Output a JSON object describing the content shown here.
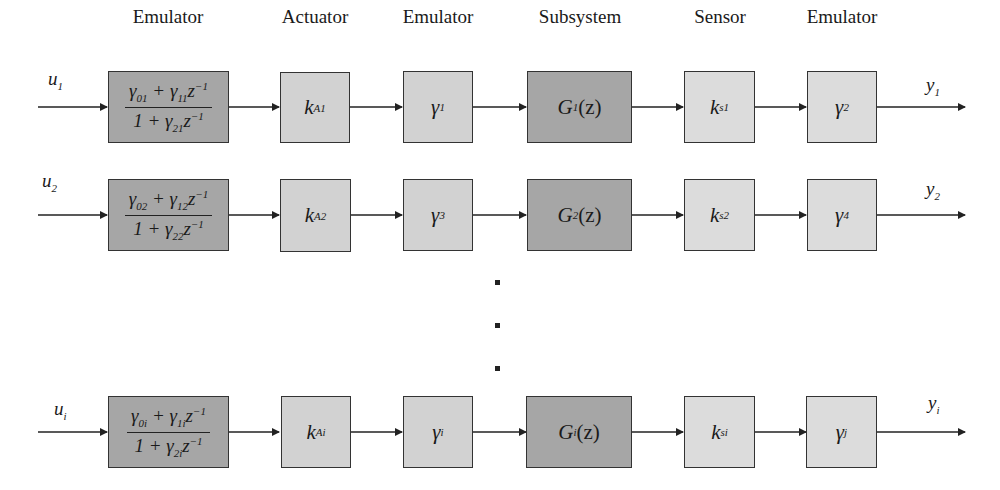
{
  "headers": [
    "Emulator",
    "Actuator",
    "Emulator",
    "Subsystem",
    "Sensor",
    "Emulator"
  ],
  "rows": [
    {
      "input": "u",
      "input_sub": "1",
      "output": "y",
      "output_sub": "1",
      "emulator_num": [
        "γ",
        "01",
        " + γ",
        "11",
        "z",
        "−1"
      ],
      "emulator_den": [
        "1 + γ",
        "21",
        "z",
        "−1"
      ],
      "actuator": [
        "k",
        "A1"
      ],
      "gamma_a": [
        "γ",
        "1"
      ],
      "subsystem": [
        "G",
        "1",
        "(z)"
      ],
      "sensor": [
        "k",
        "s1"
      ],
      "gamma_b": [
        "γ",
        "2"
      ]
    },
    {
      "input": "u",
      "input_sub": "2",
      "output": "y",
      "output_sub": "2",
      "emulator_num": [
        "γ",
        "02",
        " + γ",
        "12",
        "z",
        "−1"
      ],
      "emulator_den": [
        "1 + γ",
        "22",
        "z",
        "−1"
      ],
      "actuator": [
        "k",
        "A2"
      ],
      "gamma_a": [
        "γ",
        "3"
      ],
      "subsystem": [
        "G",
        "2",
        "(z)"
      ],
      "sensor": [
        "k",
        "s2"
      ],
      "gamma_b": [
        "γ",
        "4"
      ]
    },
    {
      "input": "u",
      "input_sub": "i",
      "output": "y",
      "output_sub": "i",
      "emulator_num": [
        "γ",
        "0i",
        " + γ",
        "1i",
        "z",
        "−1"
      ],
      "emulator_den": [
        "1 + γ",
        "2i",
        "z",
        "−1"
      ],
      "actuator": [
        "k",
        "Ai"
      ],
      "gamma_a": [
        "γ",
        "i"
      ],
      "subsystem": [
        "G",
        "i",
        "(z)"
      ],
      "sensor": [
        "k",
        "si"
      ],
      "gamma_b": [
        "γ",
        "j"
      ]
    }
  ],
  "ellipsis": "vertical dots (rows 3 … i-1 omitted)",
  "colors": {
    "dark_block": "#a6a6a6",
    "light_block": "#d2d2d2",
    "line": "#222222"
  }
}
